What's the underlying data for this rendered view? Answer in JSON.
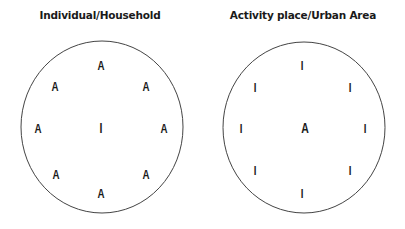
{
  "panels": [
    {
      "title": "Individual/Household",
      "center_label": "I",
      "ring_labels": [
        "A",
        "A",
        "A",
        "A",
        "A",
        "A",
        "A",
        "A"
      ]
    },
    {
      "title": "Activity place/Urban Area",
      "center_label": "A",
      "ring_labels": [
        "I",
        "I",
        "I",
        "I",
        "I",
        "I",
        "I",
        "I"
      ]
    }
  ],
  "colors": {
    "stroke": "#444444",
    "text": "#1a1a1a",
    "background": "#ffffff"
  }
}
